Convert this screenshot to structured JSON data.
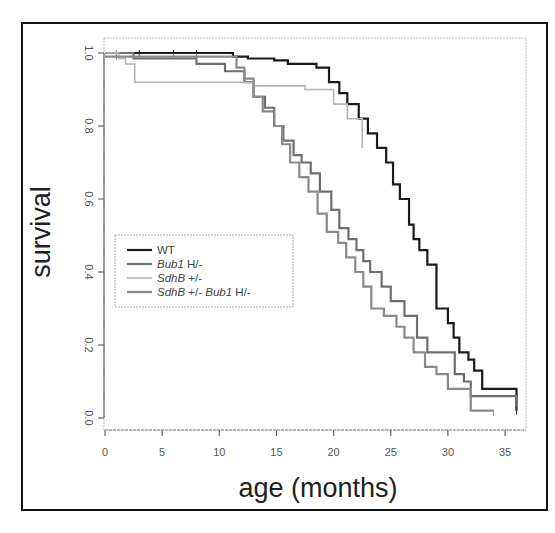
{
  "chart_data": {
    "type": "line",
    "subtype": "kaplan-meier step",
    "title": "",
    "xlabel": "age (months)",
    "ylabel": "survival",
    "xlim": [
      0,
      36
    ],
    "ylim": [
      0,
      1.0
    ],
    "xticks": [
      0,
      5,
      10,
      15,
      20,
      25,
      30,
      35
    ],
    "yticks": [
      "0.0",
      "0.2",
      "0.4",
      "0.6",
      "0.8",
      "1.0"
    ],
    "grid": false,
    "legend_position": "left-middle inside plot",
    "series": [
      {
        "name": "WT",
        "name_italic": "",
        "name_plain": "WT",
        "color": "#1a1a1a",
        "width": 2.2,
        "x": [
          0,
          10.8,
          11.2,
          12.5,
          14.8,
          16,
          18.5,
          19.6,
          20.5,
          21.2,
          22.2,
          23,
          23.8,
          24.6,
          25.2,
          25.8,
          26.6,
          27,
          27.5,
          28.2,
          29,
          30,
          30.5,
          31,
          31.8,
          32.3,
          33,
          36
        ],
        "y": [
          1.0,
          1.0,
          0.99,
          0.985,
          0.98,
          0.97,
          0.96,
          0.92,
          0.89,
          0.86,
          0.82,
          0.78,
          0.74,
          0.7,
          0.64,
          0.6,
          0.53,
          0.49,
          0.46,
          0.42,
          0.3,
          0.26,
          0.22,
          0.18,
          0.16,
          0.13,
          0.08,
          0.02
        ]
      },
      {
        "name": "Bub1 H/-",
        "name_italic": "Bub1",
        "name_plain": " H/-",
        "color": "#6e6e6e",
        "width": 2.2,
        "x": [
          0,
          2.5,
          8,
          10.5,
          12.2,
          13,
          14,
          14.8,
          15.6,
          16.5,
          17.2,
          18,
          18.8,
          19.8,
          20.5,
          21.3,
          22,
          22.6,
          23.2,
          24.2,
          25,
          26.2,
          27.3,
          28.2,
          30.4,
          30.6,
          31.4,
          32,
          36
        ],
        "y": [
          1.0,
          0.985,
          0.97,
          0.95,
          0.92,
          0.88,
          0.85,
          0.8,
          0.76,
          0.72,
          0.7,
          0.67,
          0.62,
          0.57,
          0.52,
          0.49,
          0.46,
          0.43,
          0.4,
          0.36,
          0.32,
          0.28,
          0.22,
          0.18,
          0.18,
          0.12,
          0.1,
          0.06,
          0.02
        ]
      },
      {
        "name": "SdhB +/-",
        "name_italic": "SdhB",
        "name_plain": " +/-",
        "color": "#b5b5b5",
        "width": 1.6,
        "x": [
          0,
          1.2,
          1.8,
          2.6,
          12.5,
          13,
          17.5,
          19.5,
          20,
          21.2,
          21.8,
          22.5
        ],
        "y": [
          1.0,
          0.985,
          0.97,
          0.92,
          0.92,
          0.91,
          0.9,
          0.9,
          0.86,
          0.82,
          0.82,
          0.74
        ]
      },
      {
        "name": "SdhB +/- Bub1 H/-",
        "name_italic": "SdhB",
        "name_plain": " +/- ",
        "name_italic2": "Bub1",
        "name_plain2": " H/-",
        "color": "#8a8a8a",
        "width": 2.2,
        "x": [
          0,
          11.5,
          12.2,
          13,
          13.8,
          14.8,
          15.5,
          16.2,
          17,
          17.8,
          18.6,
          19.4,
          20.4,
          21.1,
          21.9,
          22.6,
          23.3,
          24.4,
          25.5,
          26.2,
          27,
          28,
          29,
          30,
          32,
          34
        ],
        "y": [
          0.99,
          0.96,
          0.93,
          0.88,
          0.84,
          0.8,
          0.75,
          0.7,
          0.66,
          0.62,
          0.56,
          0.51,
          0.48,
          0.44,
          0.4,
          0.36,
          0.3,
          0.28,
          0.25,
          0.22,
          0.18,
          0.14,
          0.12,
          0.08,
          0.02,
          0.02
        ]
      }
    ]
  },
  "legend": {
    "items": [
      {
        "italic": "",
        "plain": "WT"
      },
      {
        "italic": "Bub1",
        "plain": " H/-"
      },
      {
        "italic": "SdhB",
        "plain": " +/-"
      },
      {
        "italic": "SdhB",
        "plain": " +/- ",
        "italic2": "Bub1",
        "plain2": " H/-"
      }
    ]
  }
}
